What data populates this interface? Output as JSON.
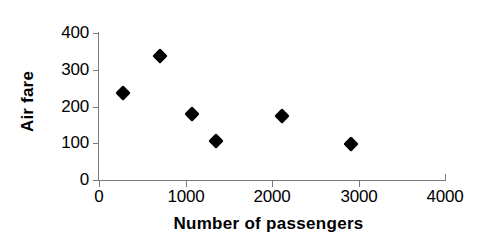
{
  "chart_data": {
    "type": "scatter",
    "title": "",
    "xlabel": "Number of passengers",
    "ylabel": "Air fare",
    "xlim": [
      0,
      4000
    ],
    "ylim": [
      0,
      400
    ],
    "xticks": [
      0,
      1000,
      2000,
      3000,
      4000
    ],
    "yticks": [
      0,
      100,
      200,
      300,
      400
    ],
    "xtick_labels": [
      "0",
      "1000",
      "2000",
      "3000",
      "4000"
    ],
    "ytick_labels": [
      "0",
      "100",
      "200",
      "300",
      "400"
    ],
    "grid": false,
    "legend": false,
    "marker": "filled-diamond",
    "marker_color": "#000000",
    "series": [
      {
        "name": "Air fare vs passengers",
        "points": [
          {
            "x": 280,
            "y": 238
          },
          {
            "x": 705,
            "y": 338
          },
          {
            "x": 1075,
            "y": 180
          },
          {
            "x": 1355,
            "y": 105
          },
          {
            "x": 2115,
            "y": 175
          },
          {
            "x": 2915,
            "y": 97
          }
        ]
      }
    ]
  },
  "axes": {
    "y_title": "Air fare",
    "x_title": "Number of passengers",
    "axis_color": "#7b7b7b"
  }
}
